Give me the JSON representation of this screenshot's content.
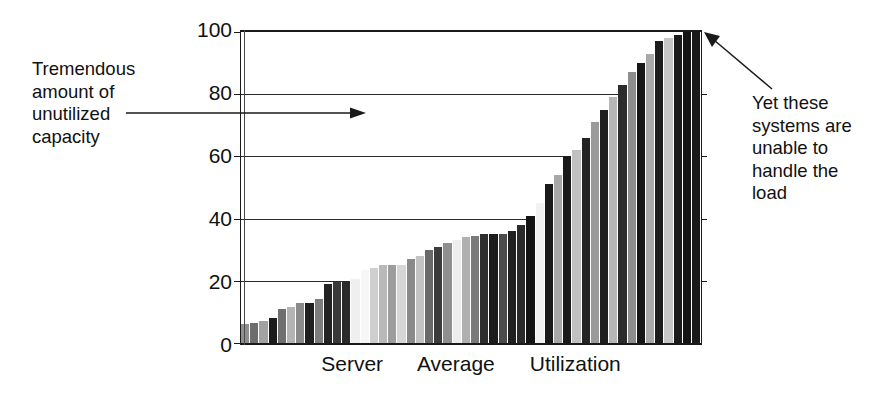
{
  "chart_data": {
    "type": "bar",
    "title": "",
    "subtitle": "",
    "xlabel": "Server      Average      Utilization",
    "ylabel": "",
    "ylim": [
      0,
      100
    ],
    "xlim_note": "unlabeled categorical index of individual servers, sorted ascending",
    "grid": "horizontal gridlines at every y tick",
    "legend": "none",
    "ytick_labels": [
      "0",
      "20",
      "40",
      "60",
      "80",
      "100"
    ],
    "ytick_values": [
      0,
      20,
      40,
      60,
      80,
      100
    ],
    "categories": [
      "1",
      "2",
      "3",
      "4",
      "5",
      "6",
      "7",
      "8",
      "9",
      "10",
      "11",
      "12",
      "13",
      "14",
      "15",
      "16",
      "17",
      "18",
      "19",
      "20",
      "21",
      "22",
      "23",
      "24",
      "25",
      "26",
      "27",
      "28",
      "29",
      "30",
      "31",
      "32",
      "33",
      "34",
      "35",
      "36",
      "37",
      "38",
      "39",
      "40",
      "41",
      "42",
      "43",
      "44",
      "45",
      "46",
      "47",
      "48",
      "49",
      "50"
    ],
    "values": [
      6,
      6.5,
      7,
      8,
      11,
      11.5,
      13,
      13,
      14,
      19,
      19.5,
      20,
      20.5,
      23.5,
      24,
      25,
      25,
      25,
      27,
      28,
      30,
      31,
      32,
      33,
      34,
      34.5,
      35,
      35,
      35,
      36,
      38,
      41,
      45,
      51,
      54,
      60,
      62,
      66,
      71,
      75,
      79,
      83,
      87,
      90,
      93,
      97,
      98,
      99,
      100,
      100
    ],
    "bar_shades": [
      "#8f8f8f",
      "#6d6d6d",
      "#a2a2a2",
      "#1c1c1c",
      "#6f6f6f",
      "#b4b4b4",
      "#8a8a8a",
      "#1f1f1f",
      "#7d7d7d",
      "#232323",
      "#3a3a3a",
      "#2a2a2a",
      "#efefef",
      "#f7f7f7",
      "#cfcfcf",
      "#b9b9b9",
      "#9d9d9d",
      "#d6d6d6",
      "#8a8a8a",
      "#c3c3c3",
      "#6a6a6a",
      "#3c3c3c",
      "#8f8f8f",
      "#ededed",
      "#b0b0b0",
      "#7a7a7a",
      "#2e2e2e",
      "#1c1c1c",
      "#4b4b4b",
      "#202020",
      "#2a2a2a",
      "#141414",
      "#f2f2f2",
      "#1a1a1a",
      "#a8a8a8",
      "#1a1a1a",
      "#c0c0c0",
      "#242424",
      "#9a9a9a",
      "#1e1e1e",
      "#b6b6b6",
      "#2c2c2c",
      "#8d8d8d",
      "#161616",
      "#a8a8a8",
      "#1c1c1c",
      "#c6c6c6",
      "#1a1a1a",
      "#141414",
      "#1a1a1a"
    ],
    "annotations": [
      {
        "id": "left",
        "text": "Tremendous\namount of\nunutilized\ncapacity",
        "leader": "horizontal line with right-pointing arrowhead into the empty plot region above the bars"
      },
      {
        "id": "right",
        "text": "Yet these\nsystems are\nunable to\nhandle the\nload",
        "leader": "diagonal line with arrowhead pointing to the top-right 100% bars"
      }
    ]
  },
  "axis": {
    "y_ticks": [
      {
        "value": 100,
        "label": "100"
      },
      {
        "value": 80,
        "label": "80"
      },
      {
        "value": 60,
        "label": "60"
      },
      {
        "value": 40,
        "label": "40"
      },
      {
        "value": 20,
        "label": "20"
      },
      {
        "value": 0,
        "label": "0"
      }
    ],
    "x_title": "Server      Average      Utilization"
  },
  "annotations": {
    "left_text": "Tremendous\namount of\nunutilized\ncapacity",
    "right_text": "Yet these\nsystems are\nunable to\nhandle the\nload"
  },
  "colors": {
    "background": "#ffffff",
    "ink": "#111111",
    "axis": "#1a1a1a",
    "grid": "#2b2b2b"
  }
}
